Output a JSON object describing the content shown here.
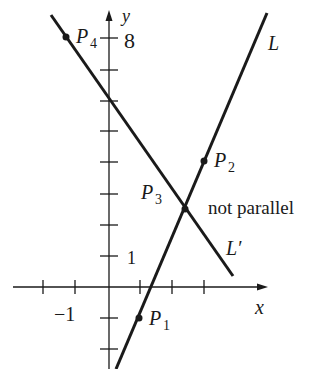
{
  "diagram": {
    "title": "",
    "type": "coordinate-plane-lines",
    "axes": {
      "x_label": "x",
      "y_label": "y",
      "x_tick_label": "−1",
      "y_tick_label_low": "1",
      "y_tick_label_high": "8",
      "x_ticks": [
        -2,
        -1,
        1,
        2,
        3
      ],
      "y_ticks": [
        -2,
        -1,
        1,
        2,
        3,
        4,
        5,
        6,
        7,
        8
      ]
    },
    "lines": [
      {
        "name": "L",
        "label": "L",
        "through": [
          "P1",
          "P2"
        ]
      },
      {
        "name": "L_prime",
        "label": "L′",
        "through": [
          "P4",
          "P3"
        ]
      }
    ],
    "points": [
      {
        "id": "P1",
        "label": "P",
        "sub": "1",
        "x": 1,
        "y": -1
      },
      {
        "id": "P2",
        "label": "P",
        "sub": "2",
        "x": 3,
        "y": 4
      },
      {
        "id": "P3",
        "label": "P",
        "sub": "3",
        "x": 2.4,
        "y": 2.5
      },
      {
        "id": "P4",
        "label": "P",
        "sub": "4",
        "x": -1.3,
        "y": 8
      }
    ],
    "annotation": "not parallel",
    "colors": {
      "ink": "#1a1a1a",
      "background": "#ffffff"
    }
  }
}
